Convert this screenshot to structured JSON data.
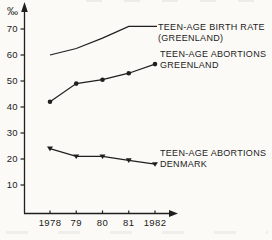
{
  "page": {
    "background_color": "#fbfaf7",
    "ink_color": "#1f1f1f"
  },
  "chart_data": {
    "type": "line",
    "title": "",
    "x_categories": [
      "1978",
      "79",
      "80",
      "81",
      "1982"
    ],
    "y_axis": {
      "unit": "‰",
      "ticks": [
        10,
        20,
        30,
        40,
        50,
        60,
        70
      ],
      "range": [
        0,
        75
      ]
    },
    "x_axis": {
      "label": ""
    },
    "grid": false,
    "legend_position": "inline-right-of-lines",
    "series": [
      {
        "name": "Teen-age birth rate (Greenland)",
        "label_lines": [
          "TEEN-AGE BIRTH RATE",
          "(GREENLAND)"
        ],
        "marker": "none",
        "values": [
          60,
          62.5,
          66.5,
          71,
          71
        ]
      },
      {
        "name": "Teen-age abortions Greenland",
        "label_lines": [
          "TEEN-AGE ABORTIONS",
          "GREENLAND"
        ],
        "marker": "circle",
        "values": [
          42,
          49,
          50.5,
          53,
          56.5
        ]
      },
      {
        "name": "Teen-age abortions Denmark",
        "label_lines": [
          "TEEN-AGE ABORTIONS",
          "DENMARK"
        ],
        "marker": "triangle-down",
        "values": [
          24,
          21,
          21,
          19.5,
          18
        ]
      }
    ]
  }
}
